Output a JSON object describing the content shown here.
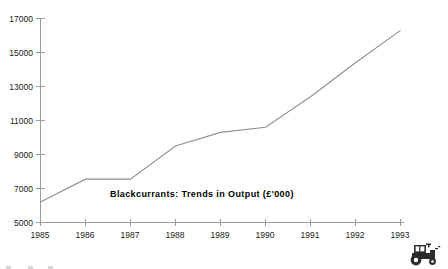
{
  "chart_data": {
    "type": "line",
    "title": "Blackcurrants:  Trends  in  Output  (£'000)",
    "xlabel": "",
    "ylabel": "",
    "x": [
      1985,
      1986,
      1987,
      1988,
      1989,
      1990,
      1991,
      1992,
      1993
    ],
    "categories": [
      "1985",
      "1986",
      "1987",
      "1988",
      "1989",
      "1990",
      "1991",
      "1992",
      "1993"
    ],
    "values": [
      6200,
      7550,
      7550,
      9500,
      10300,
      10600,
      12400,
      14400,
      16300
    ],
    "series": [
      {
        "name": "Output",
        "values": [
          6200,
          7550,
          7550,
          9500,
          10300,
          10600,
          12400,
          14400,
          16300
        ]
      }
    ],
    "ylim": [
      5000,
      17000
    ],
    "xlim": [
      1985,
      1993
    ],
    "y_ticks": [
      5000,
      7000,
      9000,
      11000,
      13000,
      15000,
      17000
    ],
    "y_tick_labels": [
      "5000",
      "7000",
      "9000",
      "11000",
      "13000",
      "15000",
      "17000"
    ],
    "x_ticks": [
      1985,
      1986,
      1987,
      1988,
      1989,
      1990,
      1991,
      1992,
      1993
    ],
    "x_tick_labels": [
      "1985",
      "1986",
      "1987",
      "1988",
      "1989",
      "1990",
      "1991",
      "1992",
      "1993"
    ],
    "grid": false,
    "legend": "none",
    "line_color": "#8e8e8e",
    "axis_color": "#9a9a9a",
    "title_position": "inside-lower-center"
  },
  "chart": {
    "title": "Blackcurrants:  Trends  in  Output  (£'000)"
  },
  "decorations": {
    "tractor_icon_name": "tractor-icon"
  }
}
